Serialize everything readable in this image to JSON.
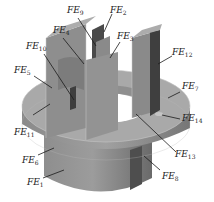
{
  "figure": {
    "colors": {
      "background": "#ffffff",
      "body_light": "#9a9a9a",
      "body_mid": "#7d7d7d",
      "body_dark": "#5a5a5a",
      "body_top": "#a8a8a8",
      "edge": "#c8c8c8",
      "leader": "#1a1a1a",
      "text": "#222222"
    },
    "labels": [
      {
        "id": "FE9",
        "prefix": "FE",
        "sub": "9",
        "x": 67,
        "y": 10
      },
      {
        "id": "FE2",
        "prefix": "FE",
        "sub": "2",
        "x": 110,
        "y": 10
      },
      {
        "id": "FE4",
        "prefix": "FE",
        "sub": "4",
        "x": 53,
        "y": 28
      },
      {
        "id": "FE3",
        "prefix": "FE",
        "sub": "3",
        "x": 117,
        "y": 34
      },
      {
        "id": "FE10",
        "prefix": "FE",
        "sub": "10",
        "x": 26,
        "y": 42
      },
      {
        "id": "FE12",
        "prefix": "FE",
        "sub": "12",
        "x": 172,
        "y": 49
      },
      {
        "id": "FE5",
        "prefix": "FE",
        "sub": "5",
        "x": 14,
        "y": 67
      },
      {
        "id": "FE7",
        "prefix": "FE",
        "sub": "7",
        "x": 182,
        "y": 82
      },
      {
        "id": "FE14",
        "prefix": "FE",
        "sub": "14",
        "x": 182,
        "y": 115
      },
      {
        "id": "FE11",
        "prefix": "FE",
        "sub": "11",
        "x": 14,
        "y": 129
      },
      {
        "id": "FE13",
        "prefix": "FE",
        "sub": "13",
        "x": 175,
        "y": 150
      },
      {
        "id": "FE6",
        "prefix": "FE",
        "sub": "6",
        "x": 22,
        "y": 157
      },
      {
        "id": "FE8",
        "prefix": "FE",
        "sub": "8",
        "x": 162,
        "y": 173
      },
      {
        "id": "FE1",
        "prefix": "FE",
        "sub": "1",
        "x": 27,
        "y": 180
      }
    ]
  }
}
